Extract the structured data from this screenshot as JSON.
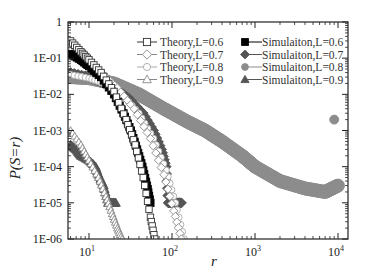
{
  "chart_data": {
    "type": "scatter",
    "title": "",
    "xlabel": "r",
    "ylabel": "P(S=r)",
    "xscale": "log",
    "yscale": "log",
    "xlim": [
      5.6,
      13000
    ],
    "ylim": [
      1e-06,
      1
    ],
    "grid": false,
    "legend_position": "upper right (two columns)",
    "x_tick_labels": [
      "10^1",
      "10^2",
      "10^3",
      "10^4"
    ],
    "x_ticks": [
      10,
      100,
      1000,
      10000
    ],
    "y_tick_labels": [
      "1",
      "1E-01",
      "1E-02",
      "1E-03",
      "1E-04",
      "1E-05",
      "1E-06"
    ],
    "y_ticks": [
      1,
      0.1,
      0.01,
      0.001,
      0.0001,
      1e-05,
      1e-06
    ],
    "series": [
      {
        "name": "Theory,L=0.6",
        "marker": "open-square",
        "color": "#333333",
        "x": [
          6,
          8,
          10,
          14,
          20,
          28,
          36,
          45,
          55,
          62
        ],
        "y": [
          0.3,
          0.15,
          0.09,
          0.04,
          0.012,
          0.002,
          0.0004,
          5e-05,
          4e-06,
          1e-06
        ]
      },
      {
        "name": "Theory,L=0.7",
        "marker": "open-diamond",
        "color": "#888888",
        "x": [
          6,
          8,
          10,
          15,
          22,
          35,
          55,
          80,
          105,
          130
        ],
        "y": [
          0.15,
          0.1,
          0.07,
          0.035,
          0.015,
          0.004,
          0.0006,
          6e-05,
          6e-06,
          1e-06
        ]
      },
      {
        "name": "Theory,L=0.8",
        "marker": "open-circle",
        "color": "#aaaaaa",
        "x": [
          6,
          10,
          15,
          25,
          40,
          60,
          85,
          110,
          140
        ],
        "y": [
          0.035,
          0.028,
          0.02,
          0.01,
          0.003,
          0.0006,
          8e-05,
          1e-05,
          1e-06
        ]
      },
      {
        "name": "Theory,L=0.9",
        "marker": "open-triangle",
        "color": "#888888",
        "x": [
          6,
          8,
          10,
          13,
          16,
          19,
          22,
          25
        ],
        "y": [
          0.001,
          0.0004,
          0.00015,
          5e-05,
          1.5e-05,
          5e-06,
          2e-06,
          1e-06
        ]
      },
      {
        "name": "Simulaiton,L=0.6",
        "marker": "filled-square",
        "color": "#000000",
        "x": [
          6,
          8,
          10,
          14,
          20,
          26,
          32,
          38,
          44,
          50,
          55
        ],
        "y": [
          0.13,
          0.09,
          0.06,
          0.03,
          0.01,
          0.003,
          0.001,
          0.0003,
          0.0001,
          3e-05,
          1e-05
        ]
      },
      {
        "name": "Simulaiton,L=0.7",
        "marker": "filled-diamond",
        "color": "#555555",
        "x": [
          6,
          10,
          15,
          22,
          30,
          45,
          60,
          75,
          85,
          90,
          100,
          115,
          130
        ],
        "y": [
          0.04,
          0.03,
          0.02,
          0.013,
          0.008,
          0.003,
          0.001,
          0.0003,
          0.0001,
          1e-05,
          1e-05,
          1e-05,
          1e-05
        ]
      },
      {
        "name": "Simulaiton,L=0.8",
        "marker": "filled-circle",
        "color": "#8c8c8c",
        "x": [
          6,
          10,
          20,
          40,
          80,
          150,
          250,
          400,
          700,
          1000,
          2000,
          4000,
          7000,
          10000,
          9000
        ],
        "y": [
          0.03,
          0.028,
          0.02,
          0.01,
          0.004,
          0.0018,
          0.001,
          0.0005,
          0.0002,
          0.0001,
          4e-05,
          2.5e-05,
          2e-05,
          3e-05,
          0.002
        ]
      },
      {
        "name": "Simulaiton,L=0.9",
        "marker": "filled-triangle",
        "color": "#555555",
        "x": [
          6,
          7,
          8,
          10,
          12,
          13,
          15,
          17,
          19,
          21
        ],
        "y": [
          0.0004,
          0.0003,
          0.0002,
          0.00015,
          0.0001,
          6e-05,
          3e-05,
          1e-05,
          1e-05,
          1e-05
        ]
      }
    ]
  },
  "axes": {
    "xlabel": "r",
    "ylabel": "P(S=r)"
  },
  "legend": {
    "theory": [
      "Theory,L=0.6",
      "Theory,L=0.7",
      "Theory,L=0.8",
      "Theory,L=0.9"
    ],
    "simulation": [
      "Simulaiton,L=0.6",
      "Simulaiton,L=0.7",
      "Simulaiton,L=0.8",
      "Simulaiton,L=0.9"
    ]
  }
}
